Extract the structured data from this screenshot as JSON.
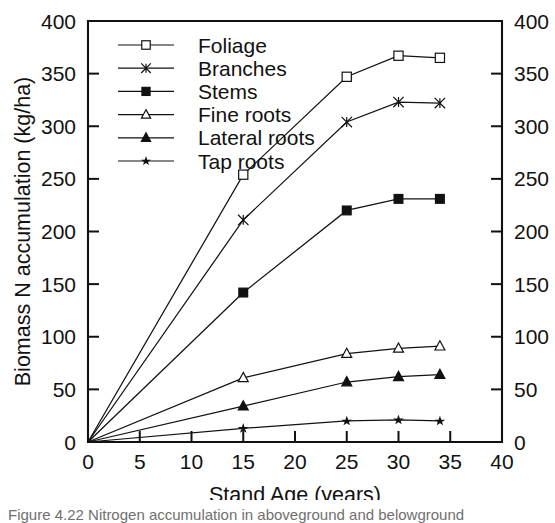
{
  "figure": {
    "background": "#ffffff",
    "ink_color": "#111111"
  },
  "chart_data": {
    "type": "line",
    "title": "",
    "xlabel": "Stand Age (years)",
    "ylabel": "Biomass N accumulation (kg/ha)",
    "xlim": [
      0,
      40
    ],
    "ylim": [
      0,
      400
    ],
    "xticks": [
      0,
      5,
      10,
      15,
      20,
      25,
      30,
      35,
      40
    ],
    "yticks": [
      0,
      50,
      100,
      150,
      200,
      250,
      300,
      350,
      400
    ],
    "xtick_labels": [
      "0",
      "5",
      "10",
      "15",
      "20",
      "25",
      "30",
      "35",
      "40"
    ],
    "ytick_labels": [
      "0",
      "50",
      "100",
      "150",
      "200",
      "250",
      "300",
      "350",
      "400"
    ],
    "grid": false,
    "mirrored_y_axis": true,
    "right_ytick_labels": [
      "0",
      "50",
      "100",
      "150",
      "200",
      "250",
      "300",
      "350",
      "400"
    ],
    "legend_position": "upper-left-inside",
    "x": [
      0,
      15,
      25,
      30,
      34
    ],
    "series": [
      {
        "name": "Foliage",
        "marker": "open-square",
        "values": [
          0,
          254,
          347,
          367,
          365
        ]
      },
      {
        "name": "Branches",
        "marker": "star-cross",
        "values": [
          0,
          211,
          304,
          323,
          322
        ]
      },
      {
        "name": "Stems",
        "marker": "filled-square",
        "values": [
          0,
          142,
          220,
          231,
          231
        ]
      },
      {
        "name": "Fine roots",
        "marker": "open-triangle",
        "values": [
          0,
          61,
          84,
          89,
          91
        ]
      },
      {
        "name": "Lateral roots",
        "marker": "filled-triangle",
        "values": [
          0,
          34,
          57,
          62,
          64
        ]
      },
      {
        "name": "Tap roots",
        "marker": "small-star",
        "values": [
          0,
          13,
          20,
          21,
          20
        ]
      }
    ]
  },
  "legend": {
    "entries": [
      {
        "label": "Foliage"
      },
      {
        "label": "Branches"
      },
      {
        "label": "Stems"
      },
      {
        "label": "Fine roots"
      },
      {
        "label": "Lateral roots"
      },
      {
        "label": "Tap roots"
      }
    ]
  },
  "caption": {
    "text": "Figure 4.22  Nitrogen accumulation in aboveground and belowground"
  }
}
